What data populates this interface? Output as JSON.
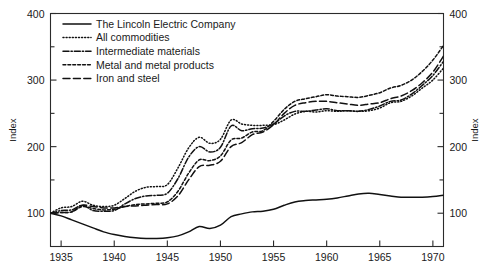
{
  "chart_data": {
    "type": "line",
    "title": "",
    "subtitle": "",
    "xlabel": "",
    "ylabel": "Index",
    "ylabel_right": "Index",
    "xlim": [
      1934,
      1971
    ],
    "ylim": [
      50,
      400
    ],
    "grid": false,
    "legend_position": "top-left",
    "y_ticks_major": [
      100,
      200,
      300,
      400
    ],
    "y_ticks_minor": [
      150,
      250,
      350
    ],
    "y_tick_labels": [
      "100",
      "200",
      "300",
      "400"
    ],
    "x_ticks": [
      1935,
      1940,
      1945,
      1950,
      1955,
      1960,
      1965,
      1970
    ],
    "x_tick_labels": [
      "1935",
      "1940",
      "1945",
      "1950",
      "1955",
      "1960",
      "1965",
      "1970"
    ],
    "x": [
      1934,
      1935,
      1936,
      1937,
      1938,
      1939,
      1940,
      1941,
      1942,
      1943,
      1944,
      1945,
      1946,
      1947,
      1948,
      1949,
      1950,
      1951,
      1952,
      1953,
      1954,
      1955,
      1956,
      1957,
      1958,
      1959,
      1960,
      1961,
      1962,
      1963,
      1964,
      1965,
      1966,
      1967,
      1968,
      1969,
      1970,
      1971
    ],
    "series": [
      {
        "name": "The Lincoln Electric Company",
        "dash": "solid",
        "values": [
          100,
          96,
          90,
          84,
          78,
          72,
          68,
          65,
          63,
          62,
          62,
          63,
          66,
          72,
          80,
          77,
          82,
          95,
          99,
          102,
          103,
          106,
          112,
          117,
          119,
          120,
          121,
          123,
          126,
          129,
          130,
          128,
          126,
          124,
          124,
          124,
          125,
          127
        ]
      },
      {
        "name": "All commodities",
        "dash": "dotted",
        "values": [
          100,
          108,
          110,
          118,
          112,
          110,
          112,
          122,
          133,
          139,
          140,
          143,
          168,
          198,
          214,
          205,
          211,
          240,
          234,
          232,
          232,
          233,
          240,
          249,
          253,
          252,
          254,
          253,
          254,
          253,
          254,
          258,
          266,
          268,
          276,
          288,
          300,
          318
        ]
      },
      {
        "name": "Intermediate materials",
        "dash": "dashdot",
        "values": [
          100,
          104,
          105,
          112,
          104,
          103,
          104,
          114,
          122,
          126,
          127,
          130,
          152,
          184,
          200,
          192,
          199,
          231,
          224,
          227,
          228,
          234,
          246,
          253,
          253,
          255,
          257,
          254,
          254,
          253,
          256,
          261,
          268,
          270,
          279,
          292,
          307,
          328
        ]
      },
      {
        "name": "Metal and metal products",
        "dash": "shortdash",
        "values": [
          100,
          101,
          102,
          110,
          107,
          105,
          106,
          110,
          113,
          114,
          115,
          117,
          133,
          160,
          180,
          179,
          186,
          210,
          213,
          222,
          224,
          238,
          256,
          268,
          272,
          275,
          278,
          276,
          275,
          274,
          277,
          281,
          288,
          292,
          300,
          313,
          330,
          352
        ]
      },
      {
        "name": "Iron and steel",
        "dash": "longdash",
        "values": [
          100,
          101,
          102,
          112,
          110,
          108,
          108,
          110,
          111,
          112,
          113,
          114,
          126,
          150,
          170,
          172,
          178,
          200,
          206,
          218,
          222,
          233,
          250,
          262,
          266,
          268,
          268,
          266,
          264,
          262,
          264,
          266,
          272,
          276,
          284,
          296,
          312,
          336
        ]
      }
    ]
  },
  "legend": {
    "items": [
      {
        "label": "The Lincoln Electric Company"
      },
      {
        "label": "All commodities"
      },
      {
        "label": "Intermediate materials"
      },
      {
        "label": "Metal and metal products"
      },
      {
        "label": "Iron and steel"
      }
    ]
  },
  "colors": {
    "line": "#111111",
    "axis": "#2b2b2b",
    "text": "#1a1a1a",
    "background": "#ffffff"
  }
}
